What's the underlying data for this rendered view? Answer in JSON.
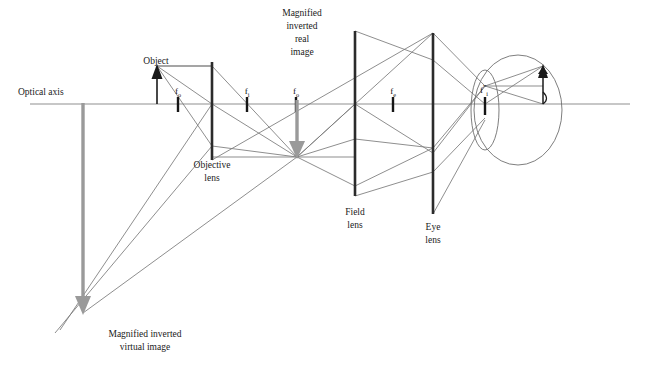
{
  "figure": {
    "background_color": "#ffffff"
  },
  "colors": {
    "axis": "#8f8f8f",
    "ray": "#7a7a7a",
    "lens": "#2b2b2b",
    "focal_tick": "#161616",
    "object_arrow": "#1a1a1a",
    "image_arrow_gray": "#9a9a9a",
    "eye_outline": "#6f6f6f",
    "text": "#1a1a1a"
  },
  "labels": {
    "optical_axis": "Optical axis",
    "object": "Object",
    "magnified_real": [
      "Magnified",
      "inverted",
      "real",
      "image"
    ],
    "magnified_virtual": [
      "Magnified inverted",
      "virtual image"
    ],
    "objective_lens": [
      "Objective",
      "lens"
    ],
    "field_lens": [
      "Field",
      "lens"
    ],
    "eye_lens": [
      "Eye",
      "lens"
    ]
  },
  "focal_marks": [
    {
      "id": "f-o-1",
      "symbol": "f",
      "subscript": "o",
      "prime": "",
      "x": 178,
      "y": 104
    },
    {
      "id": "f-i-1",
      "symbol": "f",
      "subscript": "i",
      "prime": "",
      "x": 247,
      "y": 104
    },
    {
      "id": "f-o-2",
      "symbol": "f",
      "subscript": "o",
      "prime": "",
      "x": 296,
      "y": 104
    },
    {
      "id": "f-e",
      "symbol": "f",
      "subscript": "e",
      "prime": "",
      "x": 393,
      "y": 104
    },
    {
      "id": "f-i-prime",
      "symbol": "f",
      "subscript": "i",
      "prime": "″",
      "x": 485,
      "y": 104
    }
  ],
  "lenses": [
    {
      "name": "objective",
      "x": 212,
      "top": 62,
      "bottom": 160
    },
    {
      "name": "field",
      "x": 355,
      "top": 31,
      "bottom": 196
    },
    {
      "name": "eye",
      "x": 433,
      "top": 33,
      "bottom": 214
    }
  ],
  "axis": {
    "x1": 30,
    "x2": 630,
    "y": 104
  },
  "arrows": {
    "object": {
      "x": 157,
      "base_y": 104,
      "tip_y": 66
    },
    "real_image": {
      "x": 297,
      "base_y": 103,
      "tip_y": 157
    },
    "virtual_image": {
      "x": 83,
      "base_y": 104,
      "tip_y": 313
    },
    "retina_image": {
      "x": 543,
      "base_y": 104,
      "tip_y": 66
    }
  },
  "eye": {
    "globe": {
      "cx": 518,
      "cy": 110,
      "rx": 44,
      "ry": 55
    },
    "cornea": {
      "cx": 485,
      "cy": 110,
      "rx": 14,
      "ry": 40
    }
  }
}
